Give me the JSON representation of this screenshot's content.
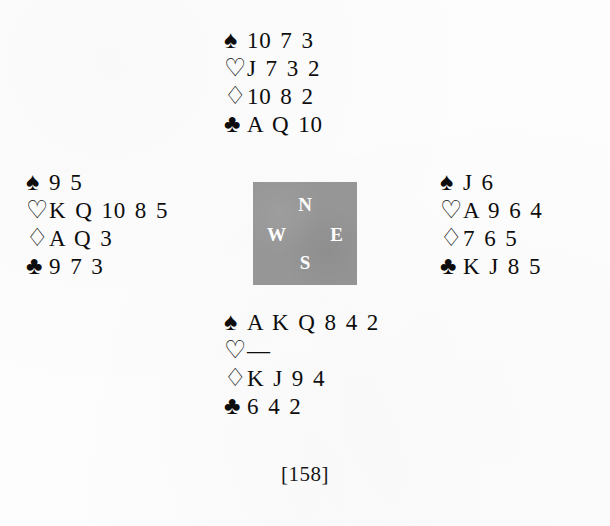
{
  "page": {
    "marker": "[158]",
    "background_color": "#fdfdfd",
    "text_color": "#0d0d0d"
  },
  "compass": {
    "box_color": "#969696",
    "letter_color": "#fefefe",
    "north": "N",
    "west": "W",
    "east": "E",
    "south": "S"
  },
  "suit_symbols": {
    "spade": "♠",
    "heart": "♡",
    "diamond": "♢",
    "club": "♣"
  },
  "chart_data": {
    "type": "table",
    "categories": [
      "North",
      "West",
      "East",
      "South"
    ],
    "suits": [
      "spade",
      "heart",
      "diamond",
      "club"
    ],
    "series": [
      {
        "name": "North",
        "values": [
          "10 7 3",
          "J 7 3 2",
          "10 8 2",
          "A Q 10"
        ]
      },
      {
        "name": "West",
        "values": [
          "9 5",
          "K Q 10 8 5",
          "A Q 3",
          "9 7 3"
        ]
      },
      {
        "name": "East",
        "values": [
          "J 6",
          "A 9 6 4",
          "7 6 5",
          "K J 8 5"
        ]
      },
      {
        "name": "South",
        "values": [
          "A K Q 8 4 2",
          "—",
          "K J 9 4",
          "6 4 2"
        ]
      }
    ]
  },
  "hands": {
    "north": {
      "label": "North",
      "spades": {
        "symbol": "♠",
        "ranks": "10 7 3"
      },
      "hearts": {
        "symbol": "♡",
        "ranks": "J 7 3 2"
      },
      "diamonds": {
        "symbol": "♢",
        "ranks": "10 8 2"
      },
      "clubs": {
        "symbol": "♣",
        "ranks": "A Q 10"
      }
    },
    "west": {
      "label": "West",
      "spades": {
        "symbol": "♠",
        "ranks": "9 5"
      },
      "hearts": {
        "symbol": "♡",
        "ranks": "K Q 10 8 5"
      },
      "diamonds": {
        "symbol": "♢",
        "ranks": "A Q 3"
      },
      "clubs": {
        "symbol": "♣",
        "ranks": "9 7 3"
      }
    },
    "east": {
      "label": "East",
      "spades": {
        "symbol": "♠",
        "ranks": "J 6"
      },
      "hearts": {
        "symbol": "♡",
        "ranks": "A 9 6 4"
      },
      "diamonds": {
        "symbol": "♢",
        "ranks": "7 6 5"
      },
      "clubs": {
        "symbol": "♣",
        "ranks": "K J 8 5"
      }
    },
    "south": {
      "label": "South",
      "spades": {
        "symbol": "♠",
        "ranks": "A K Q 8 4 2"
      },
      "hearts": {
        "symbol": "♡",
        "ranks": "—"
      },
      "diamonds": {
        "symbol": "♢",
        "ranks": "K J 9 4"
      },
      "clubs": {
        "symbol": "♣",
        "ranks": "6 4 2"
      }
    }
  }
}
